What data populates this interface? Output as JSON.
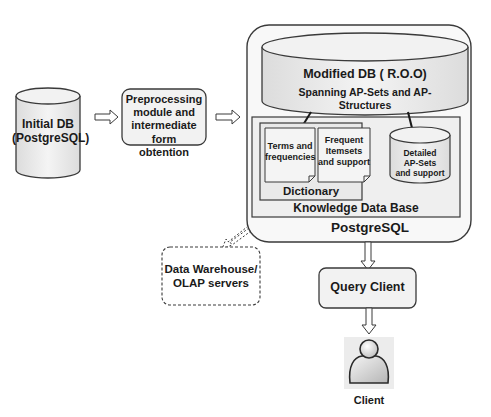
{
  "diagram": {
    "initial_db": {
      "line1": "Initial DB",
      "line2": "(PostgreSQL)"
    },
    "preprocessing": {
      "line1": "Preprocessing",
      "line2": "module and",
      "line3": "intermediate form",
      "line4": "obtention"
    },
    "postgres_container": {
      "label": "PostgreSQL"
    },
    "modified_db": {
      "title": "Modified DB ( R.O.O)",
      "subtitle_line1": "Spanning AP-Sets  and AP-",
      "subtitle_line2": "Structures"
    },
    "knowledge_base": {
      "label": "Knowledge Data Base"
    },
    "dictionary": {
      "label": "Dictionary",
      "doc1": {
        "line1": "Terms and",
        "line2": "frequencies"
      },
      "doc2": {
        "line1": "Frequent",
        "line2": "Itemsets",
        "line3": "and support"
      }
    },
    "detailed_apsets": {
      "line1": "Detailed",
      "line2": "AP-Sets",
      "line3": "and support"
    },
    "data_warehouse": {
      "line1": "Data Warehouse/",
      "line2": "OLAP servers"
    },
    "query_client": {
      "label": "Query Client"
    },
    "client": {
      "label": "Client",
      "icon": "user-icon"
    },
    "colors": {
      "stroke": "#3a3a3a",
      "fill": "#efefef",
      "fill_light": "#f6f6f6"
    }
  }
}
